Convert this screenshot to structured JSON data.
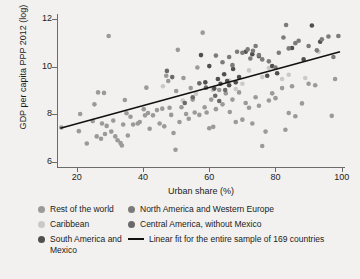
{
  "chart_data": {
    "type": "scatter",
    "title": "",
    "xlabel": "Urban share (%)",
    "ylabel": "GDP per capita PPP 2012 (log)",
    "xlim": [
      14,
      101
    ],
    "ylim": [
      5.8,
      12.2
    ],
    "xticks": [
      20,
      40,
      60,
      80,
      100
    ],
    "yticks": [
      6,
      8,
      10,
      12
    ],
    "grid": false,
    "legend_position": "below",
    "n_countries": 169,
    "colors": {
      "rest_of_world": "#9a9a9a",
      "caribbean": "#c9c9c9",
      "south_america_mexico": "#4f4f4f",
      "north_america_western_europe": "#7b7b7b",
      "central_america": "#6a6a6a",
      "fit_line": "#111111",
      "background": "#f2f1ef",
      "axis": "#6b6b6b"
    },
    "fit_line": {
      "label": "Linear fit for the entire sample of 169 countries",
      "x0": 15.0,
      "y0": 7.42,
      "x1": 99.5,
      "y1": 10.62
    },
    "series": [
      {
        "name": "Rest of the world",
        "color": "#9a9a9a",
        "points": [
          [
            15.3,
            7.45
          ],
          [
            20.6,
            7.3
          ],
          [
            21.0,
            8.02
          ],
          [
            23.0,
            6.78
          ],
          [
            24.8,
            7.72
          ],
          [
            25.3,
            8.42
          ],
          [
            26.0,
            7.08
          ],
          [
            26.4,
            8.92
          ],
          [
            27.3,
            6.98
          ],
          [
            27.6,
            7.62
          ],
          [
            28.2,
            8.9
          ],
          [
            28.5,
            7.18
          ],
          [
            29.0,
            7.52
          ],
          [
            29.6,
            11.28
          ],
          [
            30.4,
            7.28
          ],
          [
            31.0,
            7.74
          ],
          [
            31.6,
            7.08
          ],
          [
            32.3,
            6.92
          ],
          [
            33.2,
            6.8
          ],
          [
            33.6,
            6.7
          ],
          [
            34.0,
            7.58
          ],
          [
            34.5,
            8.6
          ],
          [
            35.0,
            8.05
          ],
          [
            35.4,
            7.12
          ],
          [
            36.2,
            7.9
          ],
          [
            37.0,
            7.58
          ],
          [
            38.4,
            7.62
          ],
          [
            39.0,
            7.68
          ],
          [
            40.2,
            8.22
          ],
          [
            40.6,
            7.96
          ],
          [
            41.0,
            9.12
          ],
          [
            41.5,
            8.06
          ],
          [
            42.0,
            7.4
          ],
          [
            43.0,
            7.96
          ],
          [
            44.2,
            8.18
          ],
          [
            45.0,
            7.62
          ],
          [
            45.8,
            8.24
          ],
          [
            46.4,
            7.5
          ],
          [
            47.0,
            9.62
          ],
          [
            47.6,
            9.4
          ],
          [
            48.0,
            8.28
          ],
          [
            48.5,
            7.98
          ],
          [
            49.2,
            7.22
          ],
          [
            49.8,
            6.52
          ],
          [
            50.0,
            8.98
          ],
          [
            50.5,
            10.7
          ],
          [
            51.0,
            7.68
          ],
          [
            51.6,
            8.3
          ],
          [
            52.2,
            9.52
          ],
          [
            53.0,
            8.02
          ],
          [
            53.8,
            7.82
          ],
          [
            54.4,
            9.1
          ],
          [
            55.0,
            8.62
          ],
          [
            55.6,
            8.08
          ],
          [
            56.4,
            9.96
          ],
          [
            57.0,
            7.98
          ],
          [
            58.0,
            11.42
          ],
          [
            58.6,
            8.3
          ],
          [
            59.2,
            8.08
          ],
          [
            60.0,
            7.42
          ],
          [
            60.6,
            8.62
          ],
          [
            61.2,
            7.48
          ],
          [
            62.0,
            8.22
          ],
          [
            63.0,
            9.02
          ],
          [
            64.0,
            8.42
          ],
          [
            65.0,
            8.88
          ],
          [
            66.2,
            8.1
          ],
          [
            67.0,
            8.62
          ],
          [
            68.0,
            7.68
          ],
          [
            69.0,
            8.92
          ],
          [
            70.0,
            7.78
          ],
          [
            71.0,
            8.48
          ],
          [
            72.0,
            8.28
          ],
          [
            73.0,
            7.62
          ],
          [
            74.0,
            8.72
          ],
          [
            75.0,
            8.36
          ],
          [
            76.0,
            6.68
          ],
          [
            77.0,
            7.28
          ],
          [
            78.0,
            8.58
          ],
          [
            79.0,
            8.88
          ],
          [
            80.0,
            8.68
          ],
          [
            82.0,
            9.1
          ],
          [
            83.0,
            7.36
          ],
          [
            84.0,
            8.06
          ],
          [
            85.0,
            9.18
          ],
          [
            86.0,
            7.92
          ],
          [
            88.0,
            8.46
          ],
          [
            90.0,
            9.28
          ],
          [
            92.0,
            9.22
          ],
          [
            97.0,
            7.94
          ],
          [
            98.0,
            9.48
          ]
        ]
      },
      {
        "name": "Caribbean",
        "color": "#c9c9c9",
        "points": [
          [
            46.0,
            9.18
          ],
          [
            52.0,
            8.58
          ],
          [
            56.0,
            8.86
          ],
          [
            61.0,
            9.02
          ],
          [
            66.0,
            9.42
          ],
          [
            68.0,
            9.06
          ],
          [
            70.0,
            9.28
          ],
          [
            72.0,
            9.84
          ],
          [
            76.0,
            9.56
          ],
          [
            78.0,
            9.94
          ],
          [
            82.0,
            9.48
          ],
          [
            84.0,
            9.66
          ],
          [
            89.0,
            9.52
          ],
          [
            93.0,
            10.62
          ]
        ]
      },
      {
        "name": "South America and Mexico",
        "color": "#4f4f4f",
        "points": [
          [
            57.5,
            10.48
          ],
          [
            58.8,
            9.34
          ],
          [
            60.0,
            10.02
          ],
          [
            61.5,
            9.08
          ],
          [
            62.6,
            9.48
          ],
          [
            63.4,
            9.28
          ],
          [
            64.5,
            9.68
          ],
          [
            65.4,
            9.4
          ],
          [
            66.0,
            9.22
          ],
          [
            67.2,
            9.9
          ],
          [
            68.0,
            9.34
          ],
          [
            69.0,
            9.56
          ],
          [
            71.0,
            10.62
          ],
          [
            73.0,
            10.52
          ],
          [
            75.0,
            10.44
          ],
          [
            77.5,
            9.62
          ],
          [
            79.0,
            10.02
          ],
          [
            80.5,
            9.72
          ],
          [
            85.0,
            10.78
          ],
          [
            88.5,
            10.3
          ],
          [
            91.0,
            11.72
          ],
          [
            93.5,
            11.04
          ]
        ]
      },
      {
        "name": "North America and Western Europe",
        "color": "#7b7b7b",
        "points": [
          [
            62.0,
            10.46
          ],
          [
            64.0,
            10.18
          ],
          [
            66.0,
            10.4
          ],
          [
            67.0,
            10.06
          ],
          [
            68.4,
            10.62
          ],
          [
            70.0,
            10.58
          ],
          [
            71.6,
            10.72
          ],
          [
            72.4,
            10.34
          ],
          [
            73.2,
            10.66
          ],
          [
            74.0,
            10.86
          ],
          [
            75.0,
            10.48
          ],
          [
            76.0,
            10.3
          ],
          [
            78.0,
            10.22
          ],
          [
            80.0,
            9.96
          ],
          [
            81.0,
            10.58
          ],
          [
            82.4,
            11.22
          ],
          [
            83.2,
            11.74
          ],
          [
            84.0,
            10.76
          ],
          [
            86.0,
            10.98
          ],
          [
            90.0,
            10.86
          ],
          [
            94.0,
            11.14
          ],
          [
            96.0,
            11.26
          ],
          [
            97.5,
            10.4
          ],
          [
            99.0,
            11.28
          ],
          [
            87.0,
            11.08
          ],
          [
            92.5,
            10.68
          ]
        ]
      },
      {
        "name": "Central America, without Mexico",
        "color": "#6a6a6a",
        "points": [
          [
            47.2,
            9.82
          ],
          [
            48.8,
            9.56
          ],
          [
            52.6,
            8.48
          ],
          [
            55.0,
            8.72
          ],
          [
            57.0,
            9.3
          ],
          [
            59.0,
            9.12
          ],
          [
            61.8,
            8.78
          ],
          [
            63.0,
            8.56
          ],
          [
            64.8,
            9.02
          ]
        ]
      }
    ]
  },
  "legend": {
    "entries": [
      {
        "label": "Rest of the world",
        "marker": "dot",
        "color": "#9a9a9a"
      },
      {
        "label": "Caribbean",
        "marker": "dot",
        "color": "#c9c9c9"
      },
      {
        "label": "South America and Mexico",
        "marker": "dot",
        "color": "#4f4f4f"
      },
      {
        "label": "North America and Western Europe",
        "marker": "dot",
        "color": "#7b7b7b"
      },
      {
        "label": "Central America, without Mexico",
        "marker": "dot",
        "color": "#6a6a6a"
      },
      {
        "label": "Linear fit for the entire sample of 169 countries",
        "marker": "line",
        "color": "#111111"
      }
    ]
  }
}
